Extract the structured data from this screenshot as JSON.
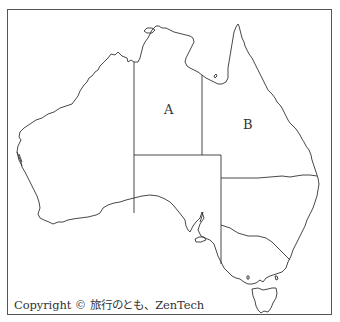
{
  "map": {
    "subject": "Australia outline map with state borders",
    "labels": {
      "region_a": "A",
      "region_b": "B"
    },
    "copyright": "Copyright © 旅行のとも、ZenTech"
  },
  "colors": {
    "outline": "#333333",
    "background": "#ffffff",
    "frame": "#555555"
  }
}
